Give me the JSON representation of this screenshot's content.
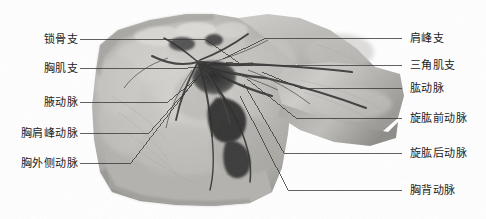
{
  "figure": {
    "kind": "anatomical-specimen-photograph",
    "background_color": "#ffffff",
    "leader_line_color": "#3a3a3a",
    "label_text_color": "#1c1c1c",
    "specimen_tone": "grayscale"
  },
  "labels_left": [
    {
      "text": "锁骨支",
      "x": 80,
      "y": 39,
      "tip_x": 205,
      "tip_y": 39
    },
    {
      "text": "胸肌支",
      "x": 80,
      "y": 68,
      "tip_x": 188,
      "tip_y": 68
    },
    {
      "text": "腋动脉",
      "x": 80,
      "y": 102,
      "tip_x": 168,
      "tip_y": 102
    },
    {
      "text": "胸肩峰动脉",
      "x": 80,
      "y": 133,
      "tip_x": 149,
      "tip_y": 133
    },
    {
      "text": "胸外侧动脉",
      "x": 80,
      "y": 163,
      "tip_x": 131,
      "tip_y": 163
    }
  ],
  "labels_right": [
    {
      "text": "肩峰支",
      "x": 410,
      "y": 38,
      "tip_x": 402,
      "tip_y": 38
    },
    {
      "text": "三角肌支",
      "x": 410,
      "y": 65,
      "tip_x": 402,
      "tip_y": 65
    },
    {
      "text": "肱动脉",
      "x": 410,
      "y": 88,
      "tip_x": 402,
      "tip_y": 88
    },
    {
      "text": "旋肱前动脉",
      "x": 410,
      "y": 118,
      "tip_x": 402,
      "tip_y": 118
    },
    {
      "text": "旋肱后动脉",
      "x": 410,
      "y": 153,
      "tip_x": 402,
      "tip_y": 153
    },
    {
      "text": "胸背动脉",
      "x": 410,
      "y": 190,
      "tip_x": 402,
      "tip_y": 190
    }
  ]
}
